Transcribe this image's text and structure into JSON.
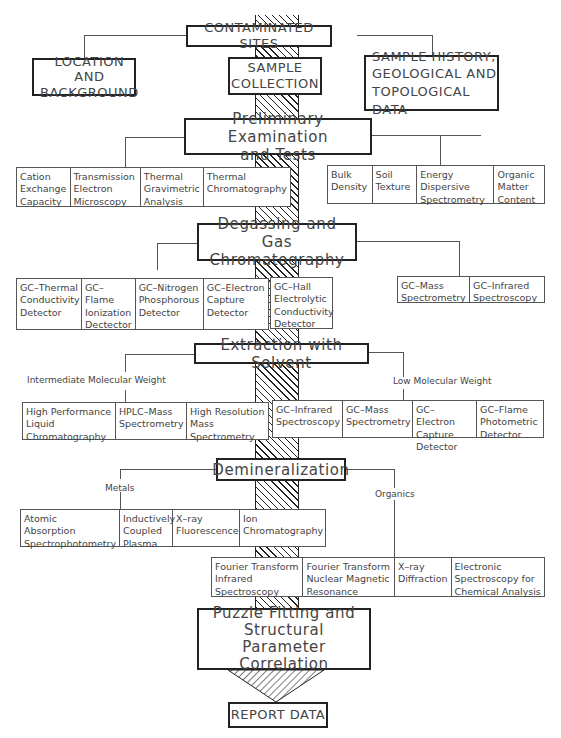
{
  "top": {
    "contaminated_sites": "CONTAMINATED SITES",
    "location": "LOCATION AND\nBACKGROUND",
    "sample_collection": "SAMPLE\nCOLLECTION",
    "sample_history": "SAMPLE HISTORY,\nGEOLOGICAL AND\nTOPOLOGICAL DATA"
  },
  "preliminary": {
    "title": "Preliminary Examination\nand Tests",
    "left": [
      "Cation\nExchange\nCapacity",
      "Transmission\nElectron\nMicroscopy",
      "Thermal\nGravimetric\nAnalysis",
      "Thermal\nChromatography"
    ],
    "right": [
      "Bulk\nDensity",
      "Soil\nTexture",
      "Energy\nDispersive\nSpectrometry",
      "Organic\nMatter\nContent"
    ]
  },
  "degassing": {
    "title": "Degassing and\nGas Chromatography",
    "left": [
      "GC–Thermal\nConductivity\nDetector",
      "GC–Flame\nIonization\nDectector",
      "GC–Nitrogen\nPhosphorous\nDetector",
      "GC–Electron\nCapture\nDetector",
      "GC–Hall\nElectrolytic\nConductivity\nDetector"
    ],
    "right": [
      "GC–Mass\nSpectrometry",
      "GC–Infrared\nSpectroscopy"
    ]
  },
  "extraction": {
    "title": "Extraction with Solvent",
    "left_label": "Intermediate Molecular Weight",
    "right_label": "Low Molecular Weight",
    "left": [
      "High Performance\nLiquid\nChromatography",
      "HPLC–Mass\nSpectrometry",
      "High Resolution\nMass\nSpectrometry"
    ],
    "right": [
      "GC–Infrared\nSpectroscopy",
      "GC–Mass\nSpectrometry",
      "GC–Electron\nCapture\nDetector",
      "GC–Flame\nPhotometric\nDetector"
    ]
  },
  "demineralization": {
    "title": "Demineralization",
    "left_label": "Metals",
    "right_label": "Organics",
    "left": [
      "Atomic\nAbsorption\nSpectrophotometry",
      "Inductively\nCoupled\nPlasma",
      "X–ray\nFluorescence",
      "Ion\nChromatography"
    ],
    "right": [
      "Fourier Transform\nInfrared\nSpectroscopy",
      "Fourier Transform\nNuclear Magnetic\nResonance",
      "X–ray\nDiffraction",
      "Electronic\nSpectroscopy for\nChemical Analysis"
    ]
  },
  "puzzle": {
    "title": "Puzzle Fitting and\nStructural\nParameter Correlation"
  },
  "report": {
    "title": "REPORT DATA"
  }
}
